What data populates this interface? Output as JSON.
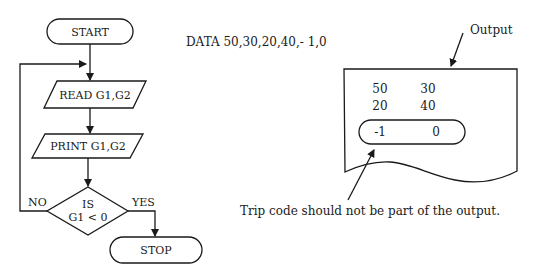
{
  "flowchart": {
    "start_label": "START",
    "read_label": "READ G1,G2",
    "print_label": "PRINT G1,G2",
    "decision_line1": "IS",
    "decision_line2": "G1 < 0",
    "no_label": "NO",
    "yes_label": "YES",
    "stop_label": "STOP"
  },
  "data_statement": "DATA 50,30,20,40,- 1,0",
  "output_panel": {
    "caption": "Output",
    "rows": [
      [
        "50",
        "30"
      ],
      [
        "20",
        "40"
      ]
    ],
    "trip_row": [
      "-1",
      "0"
    ]
  },
  "annotation": "Trip code should not be part of the output."
}
